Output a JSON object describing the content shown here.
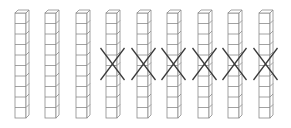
{
  "diagram": {
    "rod_count": 9,
    "cubes_per_rod": 10,
    "crossed_out_count": 6,
    "remaining_count": 3,
    "rods": [
      {
        "index": 1,
        "x": 15,
        "crossed": false
      },
      {
        "index": 2,
        "x": 45,
        "crossed": false
      },
      {
        "index": 3,
        "x": 76,
        "crossed": false
      },
      {
        "index": 4,
        "x": 106,
        "crossed": true
      },
      {
        "index": 5,
        "x": 137,
        "crossed": true
      },
      {
        "index": 6,
        "x": 167,
        "crossed": true
      },
      {
        "index": 7,
        "x": 198,
        "crossed": true
      },
      {
        "index": 8,
        "x": 228,
        "crossed": true
      },
      {
        "index": 9,
        "x": 259,
        "crossed": true
      }
    ],
    "colors": {
      "rod_stroke": "#8a8a8a",
      "cross_stroke": "#3a3a3a",
      "background": "#ffffff"
    }
  }
}
